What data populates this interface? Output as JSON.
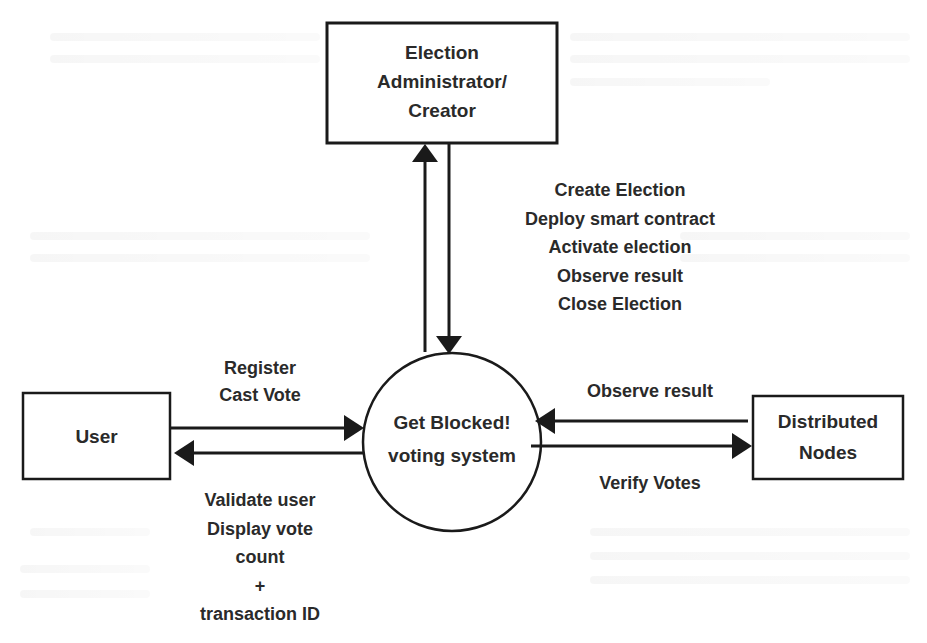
{
  "diagram": {
    "type": "data-flow-diagram",
    "nodes": {
      "admin": {
        "shape": "rectangle",
        "lines": [
          "Election",
          "Administrator/",
          "Creator"
        ]
      },
      "system": {
        "shape": "circle",
        "lines": [
          "Get Blocked!",
          "voting system"
        ]
      },
      "user": {
        "shape": "rectangle",
        "lines": [
          "User"
        ]
      },
      "nodes": {
        "shape": "rectangle",
        "lines": [
          "Distributed",
          "Nodes"
        ]
      }
    },
    "flows": {
      "admin_to_system": {
        "from": "Election Administrator/Creator",
        "to": "Get Blocked! voting system",
        "lines": [
          "Create Election",
          "Deploy smart contract",
          "Activate election",
          "Observe result",
          "Close Election"
        ]
      },
      "system_to_admin": {
        "from": "Get Blocked! voting system",
        "to": "Election Administrator/Creator"
      },
      "user_to_system": {
        "from": "User",
        "to": "Get Blocked! voting system",
        "lines": [
          "Register",
          "Cast Vote"
        ]
      },
      "system_to_user": {
        "from": "Get Blocked! voting system",
        "to": "User",
        "lines": [
          "Validate user",
          "Display vote",
          "count",
          "+",
          "transaction ID"
        ]
      },
      "nodes_to_system": {
        "from": "Distributed Nodes",
        "to": "Get Blocked! voting system",
        "lines": [
          "Observe result"
        ]
      },
      "system_to_nodes": {
        "from": "Get Blocked! voting system",
        "to": "Distributed Nodes",
        "lines": [
          "Verify Votes"
        ]
      }
    },
    "colors": {
      "stroke": "#1a1a1a",
      "text": "#2a2a2a",
      "background": "#ffffff"
    }
  }
}
